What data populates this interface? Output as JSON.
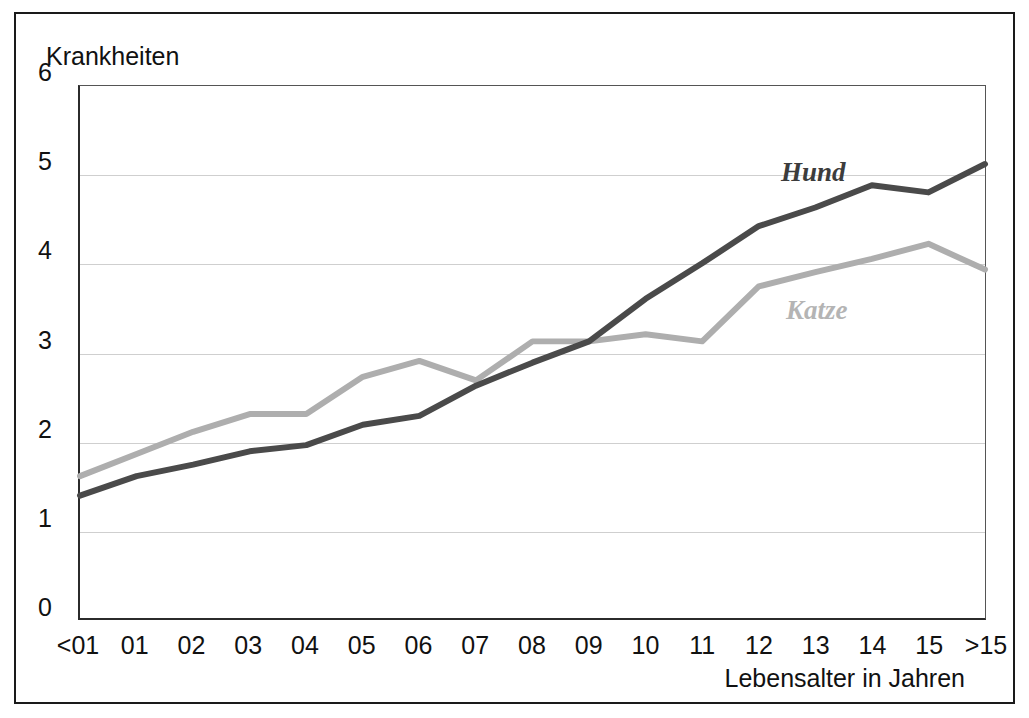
{
  "figure": {
    "y_axis_title": "Krankheiten",
    "x_axis_title": "Lebensalter in Jahren"
  },
  "chart_data": {
    "type": "line",
    "title": "",
    "xlabel": "Lebensalter in Jahren",
    "ylabel": "Krankheiten",
    "ylim": [
      0,
      6
    ],
    "yticks": [
      "0",
      "1",
      "2",
      "3",
      "4",
      "5",
      "6"
    ],
    "grid": true,
    "legend": "inline-labels",
    "categories": [
      "<01",
      "01",
      "02",
      "03",
      "04",
      "05",
      "06",
      "07",
      "08",
      "09",
      "10",
      "11",
      "12",
      "13",
      "14",
      "15",
      ">15"
    ],
    "series": [
      {
        "name": "Hund",
        "color": "#4a4a4a",
        "label_position": "upper-right",
        "values": [
          1.38,
          1.6,
          1.73,
          1.88,
          1.95,
          2.18,
          2.28,
          2.62,
          2.88,
          3.12,
          3.6,
          4.0,
          4.42,
          4.63,
          4.88,
          4.8,
          5.12
        ]
      },
      {
        "name": "Katze",
        "color": "#aeaeae",
        "label_position": "mid-right",
        "values": [
          1.6,
          1.85,
          2.1,
          2.3,
          2.3,
          2.72,
          2.9,
          2.68,
          3.12,
          3.12,
          3.2,
          3.12,
          3.74,
          3.9,
          4.05,
          4.22,
          3.93
        ]
      }
    ]
  }
}
